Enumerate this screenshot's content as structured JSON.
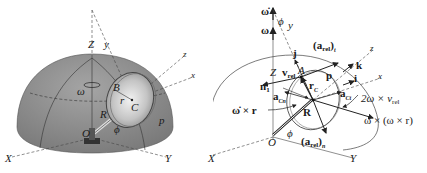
{
  "figure": {
    "left_panel": {
      "title": "Disk on hemisphere (physical view)",
      "colors": {
        "hemisphere": "#8e8e8e",
        "disk": "#cfcfcf",
        "line": "#333333"
      },
      "labels": {
        "Z": "Z",
        "y": "y",
        "z": "z",
        "x": "x",
        "omega": "ω",
        "B": "B",
        "r": "r",
        "C": "C",
        "R": "R",
        "O": "O",
        "phi": "ϕ",
        "p": "p",
        "X": "X",
        "Y": "Y"
      }
    },
    "right_panel": {
      "title": "Acceleration vector diagram",
      "labels": {
        "omega_dot": "ω̇",
        "omega": "ω",
        "phi_top": "ϕ",
        "y": "y",
        "j": "j",
        "a_rel_t_main": "(a",
        "a_rel_t_sub": "rel",
        "a_rel_t_close": ")",
        "a_rel_t_tsub": "t",
        "z": "z",
        "k": "k",
        "Z": "Z",
        "v_rel_main": "v",
        "v_rel_sub": "rel",
        "A": "A",
        "p": "p",
        "i": "i",
        "x": "x",
        "n1_main": "n",
        "n1_sub": "1",
        "r_main": "r",
        "C_sub": "C",
        "aCn_main": "a",
        "aCn_sub": "C",
        "aCn_sub2": "n",
        "aCt_main": "a",
        "aCt_sub": "C",
        "aCt_sub2": "t",
        "coriolis_main": "2ω × v",
        "coriolis_sub": "rel",
        "omega_dot_x_r": "ω̇ × r",
        "R": "R",
        "centripetal": "ω × (ω × r)",
        "phi_bottom": "ϕ",
        "O": "O",
        "a_rel_n_main": "(a",
        "a_rel_n_sub": "rel",
        "a_rel_n_close": ")",
        "a_rel_n_nsub": "n",
        "X": "X",
        "Y": "Y"
      }
    }
  }
}
